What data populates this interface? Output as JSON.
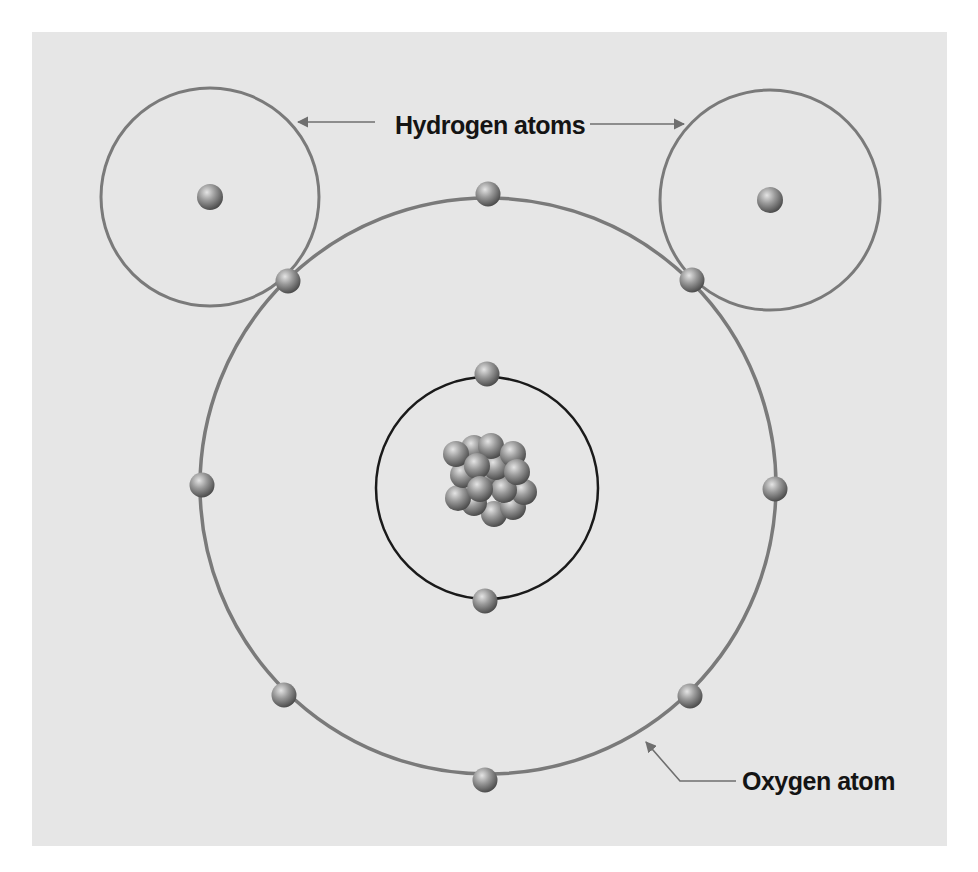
{
  "labels": {
    "hydrogen": "Hydrogen atoms",
    "oxygen": "Oxygen atom"
  },
  "colors": {
    "background": "#e6e6e6",
    "outer_shell": "#7a7a7a",
    "inner_shell": "#1a1a1a",
    "particle": "#8a8a8a",
    "label": "#141414"
  },
  "structure": {
    "hydrogen_atoms": [
      {
        "cx": 210,
        "cy": 197,
        "r": 109,
        "nucleus": {
          "cx": 210,
          "cy": 197
        }
      },
      {
        "cx": 770,
        "cy": 200,
        "r": 110,
        "nucleus": {
          "cx": 770,
          "cy": 200
        }
      }
    ],
    "oxygen_atom": {
      "outer_shell": {
        "cx": 488,
        "cy": 486,
        "r": 288
      },
      "inner_shell": {
        "cx": 487,
        "cy": 488,
        "r": 111
      },
      "outer_electrons": 8,
      "inner_electrons": 2,
      "nucleus_particles": 16
    }
  }
}
